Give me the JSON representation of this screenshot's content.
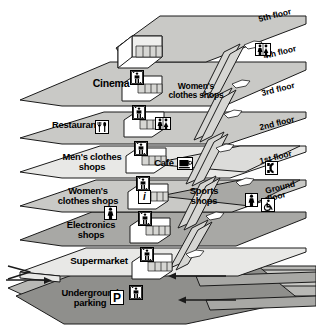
{
  "diagram": {
    "type": "isometric-building-section"
  },
  "palette": {
    "slab_light": "#e8e8e6",
    "slab_mid": "#c9c9c6",
    "slab_dark": "#a8a8a5",
    "slab_darker": "#8f8f8c",
    "road": "#b8b8b5",
    "outline": "#1a1a1a",
    "white": "#ffffff"
  },
  "floor_labels": [
    {
      "id": "f5",
      "text": "5th floor"
    },
    {
      "id": "f4",
      "text": "4th floor"
    },
    {
      "id": "f3",
      "text": "3rd floor"
    },
    {
      "id": "f2",
      "text": "2nd floor"
    },
    {
      "id": "f1",
      "text": "1st floor"
    },
    {
      "id": "f0",
      "text": "Ground\nfloor"
    }
  ],
  "zones": [
    {
      "id": "cinema",
      "text": "Cinema"
    },
    {
      "id": "womens-upper",
      "text": "Women's\nclothes shops"
    },
    {
      "id": "restaurants",
      "text": "Restaurants"
    },
    {
      "id": "mens",
      "text": "Men's clothes\nshops"
    },
    {
      "id": "cafe",
      "text": "Café"
    },
    {
      "id": "womens-lower",
      "text": "Women's\nclothes shops"
    },
    {
      "id": "sports",
      "text": "Sports\nshops"
    },
    {
      "id": "electronics",
      "text": "Electronics\nshops"
    },
    {
      "id": "supermarket",
      "text": "Supermarket"
    },
    {
      "id": "parking",
      "text": "Underground\nparking"
    }
  ],
  "icons": [
    {
      "id": "restroom-4f",
      "name": "restrooms-icon"
    },
    {
      "id": "restroom-2f",
      "name": "restrooms-icon"
    },
    {
      "id": "restroom-ground",
      "name": "restrooms-icon"
    },
    {
      "id": "restroom-electronics",
      "name": "restrooms-icon"
    },
    {
      "id": "restaurant-icon",
      "name": "restaurant-cutlery-icon"
    },
    {
      "id": "cafe-icon",
      "name": "cafe-icon"
    },
    {
      "id": "info-icon",
      "name": "information-icon",
      "glyph": "i"
    },
    {
      "id": "telephone-icon",
      "name": "telephone-icon"
    },
    {
      "id": "accessible-icon",
      "name": "wheelchair-access-icon"
    },
    {
      "id": "parking-icon",
      "name": "parking-sign-icon",
      "glyph": "P"
    }
  ],
  "lifts": {
    "name": "elevator-icon",
    "count": 7,
    "label": "lift"
  },
  "escalators": {
    "name": "escalator-icon",
    "count": 7
  }
}
